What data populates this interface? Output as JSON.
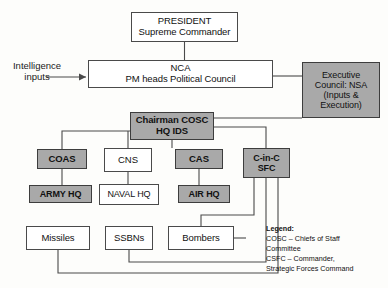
{
  "diagram": {
    "colors": {
      "shaded_fill": "#a9a9a9",
      "plain_fill": "#ffffff",
      "line": "#4a4a4a",
      "background": "#fdfdfb"
    },
    "nodes": {
      "president": {
        "line1": "PRESIDENT",
        "line2": "Supreme Commander",
        "style": "plain"
      },
      "nca": {
        "line1": "NCA",
        "line2": "PM heads Political Council",
        "style": "plain"
      },
      "executive_council": {
        "line1": "Executive",
        "line2": "Council: NSA",
        "line3": "(Inputs &",
        "line4": "Execution)",
        "style": "shaded"
      },
      "chairman_cosc": {
        "line1": "Chairman COSC",
        "line2": "HQ IDS",
        "style": "shaded"
      },
      "coas": {
        "label": "COAS",
        "style": "shaded"
      },
      "cns": {
        "label": "CNS",
        "style": "plain"
      },
      "cas": {
        "label": "CAS",
        "style": "shaded"
      },
      "cinc_sfc": {
        "line1": "C-in-C",
        "line2": "SFC",
        "style": "shaded"
      },
      "army_hq": {
        "label": "ARMY HQ",
        "style": "shaded"
      },
      "naval_hq": {
        "label": "NAVAL HQ",
        "style": "plain"
      },
      "air_hq": {
        "label": "AIR HQ",
        "style": "shaded"
      },
      "missiles": {
        "label": "Missiles",
        "style": "plain"
      },
      "ssbns": {
        "label": "SSBNs",
        "style": "plain"
      },
      "bombers": {
        "label": "Bombers",
        "style": "plain"
      }
    },
    "labels": {
      "intelligence_inputs_line1": "Intelligence",
      "intelligence_inputs_line2": "inputs"
    },
    "legend": {
      "title": "Legend:",
      "line1": "COSC – Chiefs of Staff",
      "line2": "Committee",
      "line3": "CSFC – Commander,",
      "line4": "Strategic Forces Command"
    }
  }
}
